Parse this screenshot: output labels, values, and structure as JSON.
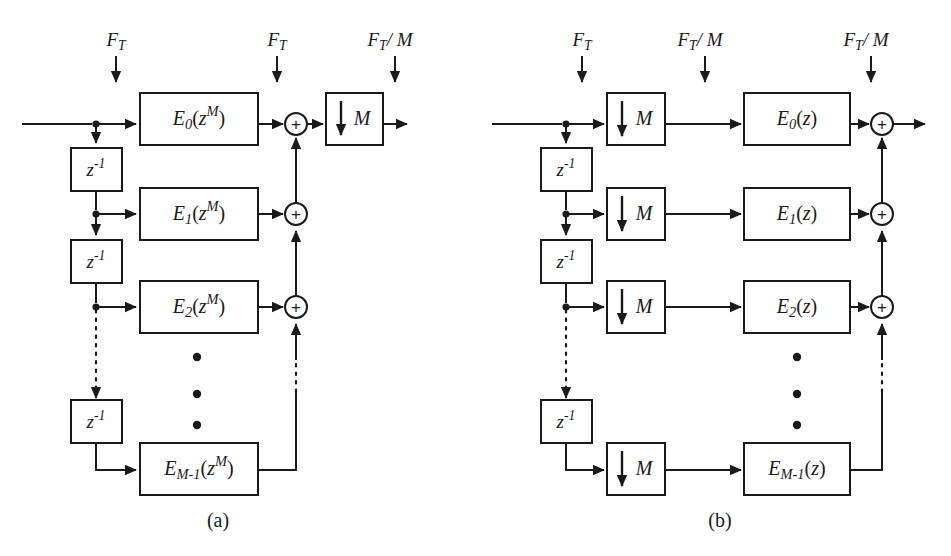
{
  "figure": {
    "background_color": "#ffffff",
    "line_color": "#1a1a1a",
    "captions": {
      "a": "(a)",
      "b": "(b)"
    }
  },
  "symbols": {
    "F": "F",
    "T": "T",
    "slash_M": "/ M",
    "M": "M",
    "z": "z",
    "minus_one": "-1",
    "plus": "+",
    "E": "E",
    "idx0": "0",
    "idx1": "1",
    "idx2": "2",
    "idxM1": "M-1",
    "z_pow_M": "M",
    "paren_open": "(",
    "paren_close": ")"
  },
  "panel_a": {
    "name": "type-1-polyphase-decimator",
    "rate_labels": [
      {
        "id": "a-rate-input",
        "text": "F_T",
        "base": "F",
        "sub": "T",
        "suffix": ""
      },
      {
        "id": "a-rate-mid",
        "text": "F_T",
        "base": "F",
        "sub": "T",
        "suffix": ""
      },
      {
        "id": "a-rate-out",
        "text": "F_T / M",
        "base": "F",
        "sub": "T",
        "suffix": "/ M"
      }
    ],
    "delay_blocks": [
      {
        "id": "a-delay-1",
        "label": "z^-1"
      },
      {
        "id": "a-delay-2",
        "label": "z^-1"
      },
      {
        "id": "a-delay-3",
        "label": "z^-1"
      },
      {
        "id": "a-delay-4",
        "label": "z^-1"
      }
    ],
    "filter_blocks": [
      {
        "id": "a-filter-0",
        "base": "E",
        "index": "0",
        "arg": "z^M",
        "label": "E_0(z^M)"
      },
      {
        "id": "a-filter-1",
        "base": "E",
        "index": "1",
        "arg": "z^M",
        "label": "E_1(z^M)"
      },
      {
        "id": "a-filter-2",
        "base": "E",
        "index": "2",
        "arg": "z^M",
        "label": "E_2(z^M)"
      },
      {
        "id": "a-filter-M1",
        "base": "E",
        "index": "M-1",
        "arg": "z^M",
        "label": "E_{M-1}(z^M)"
      }
    ],
    "adders": [
      {
        "id": "a-adder-0",
        "label": "+"
      },
      {
        "id": "a-adder-1",
        "label": "+"
      },
      {
        "id": "a-adder-2",
        "label": "+"
      }
    ],
    "decimator": {
      "id": "a-decimator",
      "label": "M",
      "factor": "M"
    },
    "ellipsis_count": 3
  },
  "panel_b": {
    "name": "type-2-polyphase-decimator",
    "rate_labels": [
      {
        "id": "b-rate-input",
        "text": "F_T",
        "base": "F",
        "sub": "T",
        "suffix": ""
      },
      {
        "id": "b-rate-mid",
        "text": "F_T / M",
        "base": "F",
        "sub": "T",
        "suffix": "/ M"
      },
      {
        "id": "b-rate-out",
        "text": "F_T / M",
        "base": "F",
        "sub": "T",
        "suffix": "/ M"
      }
    ],
    "delay_blocks": [
      {
        "id": "b-delay-1",
        "label": "z^-1"
      },
      {
        "id": "b-delay-2",
        "label": "z^-1"
      },
      {
        "id": "b-delay-3",
        "label": "z^-1"
      },
      {
        "id": "b-delay-4",
        "label": "z^-1"
      }
    ],
    "decimators": [
      {
        "id": "b-decim-0",
        "label": "M"
      },
      {
        "id": "b-decim-1",
        "label": "M"
      },
      {
        "id": "b-decim-2",
        "label": "M"
      },
      {
        "id": "b-decim-M1",
        "label": "M"
      }
    ],
    "filter_blocks": [
      {
        "id": "b-filter-0",
        "base": "E",
        "index": "0",
        "arg": "z",
        "label": "E_0(z)"
      },
      {
        "id": "b-filter-1",
        "base": "E",
        "index": "1",
        "arg": "z",
        "label": "E_1(z)"
      },
      {
        "id": "b-filter-2",
        "base": "E",
        "index": "2",
        "arg": "z",
        "label": "E_2(z)"
      },
      {
        "id": "b-filter-M1",
        "base": "E",
        "index": "M-1",
        "arg": "z",
        "label": "E_{M-1}(z)"
      }
    ],
    "adders": [
      {
        "id": "b-adder-0",
        "label": "+"
      },
      {
        "id": "b-adder-1",
        "label": "+"
      },
      {
        "id": "b-adder-2",
        "label": "+"
      }
    ],
    "ellipsis_count": 3
  }
}
